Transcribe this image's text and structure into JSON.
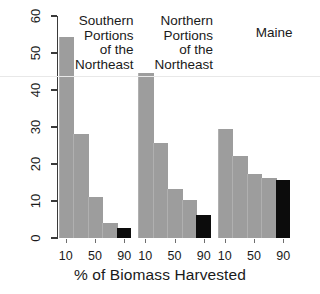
{
  "chart_data": {
    "type": "bar",
    "title": "",
    "xlabel": "% of Biomass Harvested",
    "ylabel": "% of Plots",
    "ylim": [
      0,
      60
    ],
    "yticks": [
      0,
      10,
      20,
      30,
      40,
      50,
      60
    ],
    "grid": false,
    "legend": "none",
    "categories": [
      "10",
      "30",
      "50",
      "70",
      "90"
    ],
    "xtick_labels_shown": [
      "10",
      "50",
      "90"
    ],
    "groups": [
      {
        "name": "Southern Portions of the Northeast",
        "label_lines": [
          "Southern",
          "Portions",
          "of the",
          "Northeast"
        ],
        "values": [
          54.2,
          28.0,
          11.0,
          4.0,
          2.8
        ],
        "colors": [
          "#9d9d9d",
          "#9d9d9d",
          "#9d9d9d",
          "#9d9d9d",
          "#0c0c0c"
        ]
      },
      {
        "name": "Northern Portions of the Northeast",
        "label_lines": [
          "Northern",
          "Portions",
          "of the",
          "Northeast"
        ],
        "values": [
          44.6,
          25.6,
          13.2,
          10.3,
          6.3
        ],
        "colors": [
          "#9d9d9d",
          "#9d9d9d",
          "#9d9d9d",
          "#9d9d9d",
          "#0c0c0c"
        ]
      },
      {
        "name": "Maine",
        "label_lines": [
          "Maine"
        ],
        "values": [
          29.5,
          22.1,
          17.2,
          16.1,
          15.7
        ],
        "colors": [
          "#9d9d9d",
          "#9d9d9d",
          "#9d9d9d",
          "#9d9d9d",
          "#0c0c0c"
        ]
      }
    ]
  },
  "axes": {
    "ylabel": "% of Plots",
    "xlabel": "% of Biomass Harvested",
    "ytick_labels": [
      "0",
      "10",
      "20",
      "30",
      "40",
      "50",
      "60"
    ],
    "xtick_labels": [
      "10",
      "50",
      "90",
      "10",
      "50",
      "90",
      "10",
      "50",
      "90"
    ]
  },
  "group_labels": {
    "g0": [
      "Southern",
      "Portions",
      "of the",
      "Northeast"
    ],
    "g1": [
      "Northern",
      "Portions",
      "of the",
      "Northeast"
    ],
    "g2": [
      "Maine"
    ]
  },
  "colors": {
    "bar_gray": "#9d9d9d",
    "bar_black": "#0c0c0c",
    "axis": "#3a3a3a",
    "text": "#1a1a1a",
    "background": "#ffffff"
  }
}
